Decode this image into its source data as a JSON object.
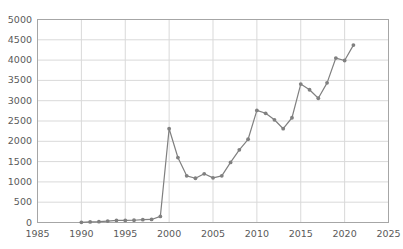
{
  "chart_data": {
    "type": "line",
    "title": "",
    "subtitle": "",
    "xlabel": "",
    "ylabel": "",
    "xlim": [
      1985,
      2025
    ],
    "ylim": [
      0,
      5000
    ],
    "grid": true,
    "legend": "none",
    "marker": "circle",
    "line_color": "#808080",
    "marker_color": "#808080",
    "grid_color": "#d9d9d9",
    "axis_color": "#a6a6a6",
    "text_color": "#5a5a5a",
    "x_ticks": [
      1985,
      1990,
      1995,
      2000,
      2005,
      2010,
      2015,
      2020,
      2025
    ],
    "x_tick_labels": [
      "1985",
      "1990",
      "1995",
      "2000",
      "2005",
      "2010",
      "2015",
      "2020",
      "2025"
    ],
    "y_ticks": [
      0,
      500,
      1000,
      1500,
      2000,
      2500,
      3000,
      3500,
      4000,
      4500,
      5000
    ],
    "y_tick_labels": [
      "0",
      "500",
      "1000",
      "1500",
      "2000",
      "2500",
      "3000",
      "3500",
      "4000",
      "4500",
      "5000"
    ],
    "x": [
      1990,
      1991,
      1992,
      1993,
      1994,
      1995,
      1996,
      1997,
      1998,
      1999,
      2000,
      2001,
      2002,
      2003,
      2004,
      2005,
      2006,
      2007,
      2008,
      2009,
      2010,
      2011,
      2012,
      2013,
      2014,
      2015,
      2016,
      2017,
      2018,
      2019,
      2020,
      2021
    ],
    "values": [
      5,
      15,
      20,
      35,
      50,
      50,
      55,
      70,
      75,
      150,
      2310,
      1600,
      1150,
      1090,
      1200,
      1100,
      1150,
      1480,
      1790,
      2050,
      2760,
      2690,
      2530,
      2310,
      2580,
      3410,
      3270,
      3060,
      3440,
      4050,
      3990,
      4370
    ],
    "series": [
      {
        "name": "series-1",
        "values": [
          5,
          15,
          20,
          35,
          50,
          50,
          55,
          70,
          75,
          150,
          2310,
          1600,
          1150,
          1090,
          1200,
          1100,
          1150,
          1480,
          1790,
          2050,
          2760,
          2690,
          2530,
          2310,
          2580,
          3410,
          3270,
          3060,
          3440,
          4050,
          3990,
          4370
        ]
      }
    ]
  }
}
